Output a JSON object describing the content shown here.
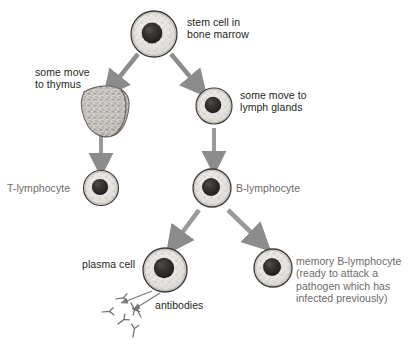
{
  "diagram": {
    "type": "biology-flowchart",
    "background_color": "#ffffff",
    "text_color_primary": "#231f20",
    "text_color_secondary": "#6e6a68",
    "arrow_color": "#8c8c8c",
    "cell_outline_color": "#3b3b3b",
    "cell_nucleus_color": "#2e2b2a",
    "cell_cytoplasm_color": "#e9e7e5"
  },
  "top_cut_text": "",
  "labels": {
    "stem_cell": "stem cell in\nbone marrow",
    "some_move_to_thymus": "some move\nto thymus",
    "some_move_to_lymph_glands": "some move to\nlymph glands",
    "t_lymphocyte": "T-lymphocyte",
    "b_lymphocyte": "B-lymphocyte",
    "plasma_cell": "plasma cell",
    "antibodies": "antibodies",
    "memory_b_lymphocyte": "memory B-lymphocyte\n(ready to attack a\npathogen which has\ninfected previously)"
  },
  "nodes": [
    {
      "id": "stem-cell",
      "label": "stem cell in bone marrow",
      "cx": 154,
      "cy": 34,
      "r": 23
    },
    {
      "id": "thymus-organ",
      "label": "thymus",
      "cx": 103,
      "cy": 113
    },
    {
      "id": "lymph-gland-cell",
      "label": "some move to lymph glands",
      "cx": 214,
      "cy": 106,
      "r": 18
    },
    {
      "id": "t-lymphocyte",
      "label": "T-lymphocyte",
      "cx": 101,
      "cy": 188,
      "r": 17
    },
    {
      "id": "b-lymphocyte",
      "label": "B-lymphocyte",
      "cx": 212,
      "cy": 188,
      "r": 19
    },
    {
      "id": "plasma-cell",
      "label": "plasma cell",
      "cx": 165,
      "cy": 270,
      "r": 22
    },
    {
      "id": "memory-b-lymphocyte",
      "label": "memory B-lymphocyte",
      "cx": 273,
      "cy": 268,
      "r": 19
    }
  ],
  "edges": [
    {
      "from": "stem-cell",
      "to": "thymus-organ",
      "kind": "thick-arrow"
    },
    {
      "from": "stem-cell",
      "to": "lymph-gland-cell",
      "kind": "thick-arrow"
    },
    {
      "from": "thymus-organ",
      "to": "t-lymphocyte",
      "kind": "thick-arrow"
    },
    {
      "from": "lymph-gland-cell",
      "to": "b-lymphocyte",
      "kind": "thick-arrow"
    },
    {
      "from": "b-lymphocyte",
      "to": "plasma-cell",
      "kind": "thick-arrow"
    },
    {
      "from": "b-lymphocyte",
      "to": "memory-b-lymphocyte",
      "kind": "thick-arrow"
    },
    {
      "from": "antibodies-label",
      "to": "antibody-cluster",
      "kind": "thin-arrow"
    },
    {
      "from": "plasma-cell",
      "to": "antibody-cluster",
      "kind": "thin-arrow"
    }
  ],
  "antibody_count": 6
}
